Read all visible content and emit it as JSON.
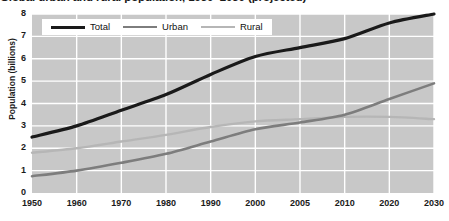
{
  "title": "Global urban and rural population, 1950–2030 (projected)",
  "colors": {
    "total": "#1a1a1a",
    "urban": "#7d7d7d",
    "rural": "#b6b6b6",
    "plot_background": "#c8c8c8",
    "gridline": "#ffffff",
    "text": "#1a1a1a"
  },
  "legend": {
    "position": "top-left-inside",
    "items": [
      {
        "label": "Total",
        "color_key": "total",
        "thickness": 3.2
      },
      {
        "label": "Urban",
        "color_key": "urban",
        "thickness": 2.6
      },
      {
        "label": "Rural",
        "color_key": "rural",
        "thickness": 2.2
      }
    ]
  },
  "axes": {
    "ylabel": "Population (billions)",
    "xlabel": "",
    "ylim": [
      0,
      8
    ],
    "yticks": [
      0,
      1,
      2,
      3,
      4,
      5,
      6,
      7,
      8
    ],
    "ytick_labels": [
      "0",
      "1",
      "2",
      "3",
      "4",
      "5",
      "6",
      "7",
      "8"
    ],
    "xtick_labels": [
      "1950",
      "1960",
      "1970",
      "1980",
      "1990",
      "2000",
      "2005",
      "2010",
      "2020",
      "2030"
    ],
    "grid": true
  },
  "chart_data": {
    "type": "line",
    "title": "Global urban and rural population, 1950–2030 (projected)",
    "xlabel": "",
    "ylabel": "Population (billions)",
    "ylim": [
      0,
      8
    ],
    "grid": true,
    "legend_position": "top-left-inside",
    "categories": [
      "1950",
      "1960",
      "1970",
      "1980",
      "1990",
      "2000",
      "2005",
      "2010",
      "2020",
      "2030"
    ],
    "series": [
      {
        "name": "Total",
        "color": "#1a1a1a",
        "values": [
          2.5,
          3.0,
          3.7,
          4.4,
          5.3,
          6.1,
          6.5,
          6.9,
          7.6,
          8.0
        ]
      },
      {
        "name": "Urban",
        "color": "#7d7d7d",
        "values": [
          0.75,
          1.0,
          1.35,
          1.75,
          2.3,
          2.85,
          3.15,
          3.5,
          4.2,
          4.9
        ]
      },
      {
        "name": "Rural",
        "color": "#b6b6b6",
        "values": [
          1.8,
          2.0,
          2.3,
          2.6,
          2.95,
          3.2,
          3.3,
          3.4,
          3.4,
          3.3
        ]
      }
    ]
  }
}
